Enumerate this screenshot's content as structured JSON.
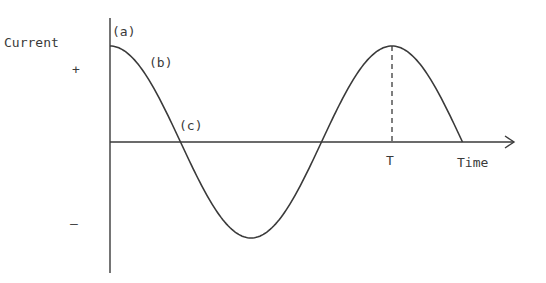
{
  "diagram": {
    "y_axis_label": "Current",
    "positive_sign": "+",
    "negative_sign": "–",
    "x_axis_label": "Time",
    "period_label": "T",
    "point_labels": [
      "(a)",
      "(b)",
      "(c)"
    ],
    "colors": {
      "ink": "#3a3a3a",
      "background": "#ffffff"
    }
  },
  "chart_data": {
    "type": "line",
    "title": "",
    "xlabel": "Time",
    "ylabel": "Current",
    "function": "cosine",
    "amplitude": 1,
    "period_label": "T",
    "x_range_in_periods": [
      0,
      1.25
    ],
    "y_range": [
      -1,
      1
    ],
    "annotations": [
      {
        "label": "(a)",
        "phase_fraction": 0.0,
        "description": "maximum positive current"
      },
      {
        "label": "(b)",
        "phase_fraction": 0.125,
        "description": "current decreasing"
      },
      {
        "label": "(c)",
        "phase_fraction": 0.25,
        "description": "zero current"
      }
    ],
    "marker": {
      "label": "T",
      "at_period_fraction": 1.0,
      "style": "dashed vertical"
    },
    "legend": "none",
    "grid": false
  }
}
